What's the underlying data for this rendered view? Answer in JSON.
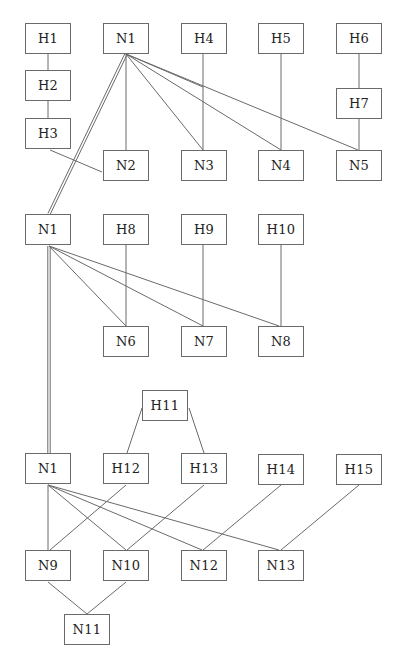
{
  "diagram": {
    "sections": [
      {
        "id": "top",
        "nodes": [
          {
            "id": "H1",
            "label": "H1",
            "x": 25,
            "y": 23
          },
          {
            "id": "N1a",
            "label": "N1",
            "x": 103,
            "y": 23
          },
          {
            "id": "H4",
            "label": "H4",
            "x": 181,
            "y": 23
          },
          {
            "id": "H5",
            "label": "H5",
            "x": 258,
            "y": 23
          },
          {
            "id": "H6",
            "label": "H6",
            "x": 336,
            "y": 23
          },
          {
            "id": "H2",
            "label": "H2",
            "x": 25,
            "y": 70
          },
          {
            "id": "H7",
            "label": "H7",
            "x": 336,
            "y": 88
          },
          {
            "id": "H3",
            "label": "H3",
            "x": 25,
            "y": 118
          },
          {
            "id": "N2",
            "label": "N2",
            "x": 103,
            "y": 150
          },
          {
            "id": "N3",
            "label": "N3",
            "x": 181,
            "y": 150
          },
          {
            "id": "N4",
            "label": "N4",
            "x": 258,
            "y": 150
          },
          {
            "id": "N5",
            "label": "N5",
            "x": 336,
            "y": 150
          }
        ]
      },
      {
        "id": "middle",
        "nodes": [
          {
            "id": "N1b",
            "label": "N1",
            "x": 25,
            "y": 214
          },
          {
            "id": "H8",
            "label": "H8",
            "x": 103,
            "y": 214
          },
          {
            "id": "H9",
            "label": "H9",
            "x": 181,
            "y": 214
          },
          {
            "id": "H10",
            "label": "H10",
            "x": 258,
            "y": 214
          },
          {
            "id": "N6",
            "label": "N6",
            "x": 103,
            "y": 326
          },
          {
            "id": "N7",
            "label": "N7",
            "x": 181,
            "y": 326
          },
          {
            "id": "N8",
            "label": "N8",
            "x": 258,
            "y": 326
          }
        ]
      },
      {
        "id": "bottom",
        "nodes": [
          {
            "id": "H11",
            "label": "H11",
            "x": 142,
            "y": 390
          },
          {
            "id": "N1c",
            "label": "N1",
            "x": 25,
            "y": 453
          },
          {
            "id": "H12",
            "label": "H12",
            "x": 103,
            "y": 453
          },
          {
            "id": "H13",
            "label": "H13",
            "x": 181,
            "y": 453
          },
          {
            "id": "H14",
            "label": "H14",
            "x": 258,
            "y": 454
          },
          {
            "id": "H15",
            "label": "H15",
            "x": 336,
            "y": 454
          },
          {
            "id": "N9",
            "label": "N9",
            "x": 25,
            "y": 550
          },
          {
            "id": "N10",
            "label": "N10",
            "x": 103,
            "y": 550
          },
          {
            "id": "N12",
            "label": "N12",
            "x": 181,
            "y": 550
          },
          {
            "id": "N13",
            "label": "N13",
            "x": 258,
            "y": 550
          },
          {
            "id": "N11",
            "label": "N11",
            "x": 64,
            "y": 614
          }
        ]
      }
    ],
    "edges": [
      {
        "x1": 48,
        "y1": 54,
        "x2": 48,
        "y2": 70
      },
      {
        "x1": 48,
        "y1": 101,
        "x2": 48,
        "y2": 118
      },
      {
        "x1": 50,
        "y1": 150,
        "x2": 102,
        "y2": 172
      },
      {
        "x1": 126,
        "y1": 54,
        "x2": 126,
        "y2": 150
      },
      {
        "x1": 126,
        "y1": 54,
        "x2": 203,
        "y2": 150
      },
      {
        "x1": 126,
        "y1": 54,
        "x2": 281,
        "y2": 150
      },
      {
        "x1": 126,
        "y1": 54,
        "x2": 358,
        "y2": 150
      },
      {
        "x1": 126,
        "y1": 54,
        "x2": 203,
        "y2": 87
      },
      {
        "x1": 203,
        "y1": 54,
        "x2": 203,
        "y2": 150
      },
      {
        "x1": 281,
        "y1": 54,
        "x2": 281,
        "y2": 150
      },
      {
        "x1": 359,
        "y1": 54,
        "x2": 359,
        "y2": 88
      },
      {
        "x1": 359,
        "y1": 119,
        "x2": 359,
        "y2": 150
      },
      {
        "x1": 49,
        "y1": 246,
        "x2": 126,
        "y2": 326
      },
      {
        "x1": 49,
        "y1": 246,
        "x2": 203,
        "y2": 326
      },
      {
        "x1": 49,
        "y1": 246,
        "x2": 279,
        "y2": 326
      },
      {
        "x1": 126,
        "y1": 245,
        "x2": 126,
        "y2": 326
      },
      {
        "x1": 203,
        "y1": 245,
        "x2": 203,
        "y2": 326
      },
      {
        "x1": 281,
        "y1": 245,
        "x2": 281,
        "y2": 326
      },
      {
        "x1": 142,
        "y1": 408,
        "x2": 127,
        "y2": 453
      },
      {
        "x1": 189,
        "y1": 408,
        "x2": 204,
        "y2": 453
      },
      {
        "x1": 48,
        "y1": 485,
        "x2": 48,
        "y2": 550
      },
      {
        "x1": 48,
        "y1": 485,
        "x2": 126,
        "y2": 550
      },
      {
        "x1": 48,
        "y1": 485,
        "x2": 202,
        "y2": 550
      },
      {
        "x1": 48,
        "y1": 485,
        "x2": 279,
        "y2": 550
      },
      {
        "x1": 126,
        "y1": 485,
        "x2": 50,
        "y2": 550
      },
      {
        "x1": 204,
        "y1": 485,
        "x2": 127,
        "y2": 550
      },
      {
        "x1": 281,
        "y1": 485,
        "x2": 203,
        "y2": 550
      },
      {
        "x1": 359,
        "y1": 485,
        "x2": 281,
        "y2": 550
      },
      {
        "x1": 48,
        "y1": 582,
        "x2": 87,
        "y2": 614
      },
      {
        "x1": 126,
        "y1": 582,
        "x2": 87,
        "y2": 614
      }
    ],
    "double_edges": [
      {
        "x1": 126,
        "y1": 54,
        "x2": 49,
        "y2": 214
      },
      {
        "x1": 49,
        "y1": 246,
        "x2": 49,
        "y2": 453
      }
    ]
  }
}
